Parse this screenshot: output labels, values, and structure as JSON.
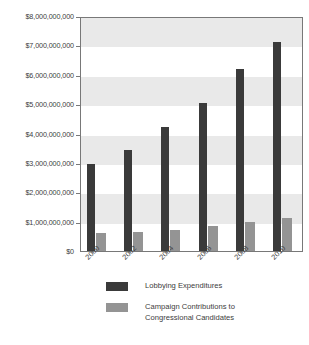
{
  "chart_data": {
    "type": "bar",
    "title": "",
    "xlabel": "",
    "ylabel": "",
    "categories": [
      "2000",
      "2002",
      "2004",
      "2006",
      "2008",
      "2010"
    ],
    "series": [
      {
        "name": "Lobbying Expenditures",
        "color": "#3a3a3a",
        "values": [
          2960000000,
          3440000000,
          4220000000,
          5030000000,
          6200000000,
          7120000000
        ]
      },
      {
        "name": "Campaign Contributions to Congressional Candidates",
        "color": "#949494",
        "values": [
          610000000,
          650000000,
          710000000,
          850000000,
          990000000,
          1120000000
        ]
      }
    ],
    "ylim": [
      0,
      8000000000
    ],
    "ytick_values": [
      0,
      1000000000,
      2000000000,
      3000000000,
      4000000000,
      5000000000,
      6000000000,
      7000000000,
      8000000000
    ],
    "ytick_labels": [
      "$0",
      "$1,000,000,000",
      "$2,000,000,000",
      "$3,000,000,000",
      "$4,000,000,000",
      "$5,000,000,000",
      "$6,000,000,000",
      "$7,000,000,000",
      "$8,000,000,000"
    ],
    "grid": false,
    "banding": true,
    "band_color": "#e9e9e9",
    "legend_position": "bottom",
    "legend": [
      {
        "label": "Lobbying Expenditures",
        "color": "#3a3a3a"
      },
      {
        "label": "Campaign Contributions to\nCongressional Candidates",
        "color": "#949494"
      }
    ]
  },
  "legend_lines": {
    "entry1": "Lobbying Expenditures",
    "entry2_line1": "Campaign Contributions to",
    "entry2_line2": "Congressional Candidates"
  }
}
